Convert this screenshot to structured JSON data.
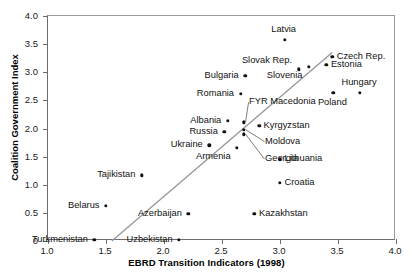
{
  "chart_data": {
    "type": "scatter",
    "title": "",
    "xlabel": "EBRD Transition Indicators (1998)",
    "ylabel": "Coalition Government Index",
    "xlim": [
      1.0,
      4.0
    ],
    "ylim": [
      0,
      4.0
    ],
    "xticks": [
      "1.0",
      "1.5",
      "2.0",
      "2.5",
      "3.0",
      "3.5",
      "4.0"
    ],
    "xtick_values": [
      1.0,
      1.5,
      2.0,
      2.5,
      3.0,
      3.5,
      4.0
    ],
    "yticks": [
      "0",
      "0.5",
      "1.0",
      "1.5",
      "2.0",
      "2.5",
      "3.0",
      "3.5",
      "4.0"
    ],
    "ytick_values": [
      0,
      0.5,
      1.0,
      1.5,
      2.0,
      2.5,
      3.0,
      3.5,
      4.0
    ],
    "grid": false,
    "legend": null,
    "trendline": {
      "x0": 1.55,
      "y0": 0.0,
      "x1": 3.45,
      "y1": 3.35,
      "color": "#999999"
    },
    "points": [
      {
        "label": "Latvia",
        "x": 3.04,
        "y": 3.58,
        "label_pos": "above"
      },
      {
        "label": "Czech Rep.",
        "x": 3.45,
        "y": 3.28,
        "label_pos": "right"
      },
      {
        "label": "Slovak Rep.",
        "x": 3.16,
        "y": 3.05,
        "label_pos": "above-left"
      },
      {
        "label": "Estonia",
        "x": 3.4,
        "y": 3.13,
        "label_pos": "right"
      },
      {
        "label": "Slovenia",
        "x": 3.25,
        "y": 3.1,
        "label_pos": "below-left"
      },
      {
        "label": "Bulgaria",
        "x": 2.7,
        "y": 2.94,
        "label_pos": "left"
      },
      {
        "label": "Romania",
        "x": 2.66,
        "y": 2.62,
        "label_pos": "left"
      },
      {
        "label": "Hungary",
        "x": 3.69,
        "y": 2.63,
        "label_pos": "above"
      },
      {
        "label": "Poland",
        "x": 3.46,
        "y": 2.64,
        "label_pos": "below"
      },
      {
        "label": "FYR Macedonia",
        "x": 2.69,
        "y": 2.11,
        "label_pos": "leader-up"
      },
      {
        "label": "Albania",
        "x": 2.55,
        "y": 2.14,
        "label_pos": "left"
      },
      {
        "label": "Kyrgyzstan",
        "x": 2.82,
        "y": 2.05,
        "label_pos": "right"
      },
      {
        "label": "Russia",
        "x": 2.52,
        "y": 1.94,
        "label_pos": "left"
      },
      {
        "label": "Moldova",
        "x": 2.69,
        "y": 1.98,
        "label_pos": "leader-right"
      },
      {
        "label": "Georgia",
        "x": 2.69,
        "y": 1.9,
        "label_pos": "leader-right"
      },
      {
        "label": "Ukraine",
        "x": 2.39,
        "y": 1.7,
        "label_pos": "left"
      },
      {
        "label": "Armenia",
        "x": 2.63,
        "y": 1.66,
        "label_pos": "below-left"
      },
      {
        "label": "Lithuania",
        "x": 3.0,
        "y": 1.45,
        "label_pos": "right"
      },
      {
        "label": "Tajikistan",
        "x": 1.81,
        "y": 1.17,
        "label_pos": "left"
      },
      {
        "label": "Croatia",
        "x": 3.0,
        "y": 1.03,
        "label_pos": "right"
      },
      {
        "label": "Belarus",
        "x": 1.5,
        "y": 0.63,
        "label_pos": "left"
      },
      {
        "label": "Azerbaijan",
        "x": 2.21,
        "y": 0.48,
        "label_pos": "left"
      },
      {
        "label": "Kazakhstan",
        "x": 2.78,
        "y": 0.48,
        "label_pos": "right"
      },
      {
        "label": "Turkmenistan",
        "x": 1.4,
        "y": 0.02,
        "label_pos": "left"
      },
      {
        "label": "Uzbekistan",
        "x": 2.13,
        "y": 0.02,
        "label_pos": "left"
      }
    ]
  }
}
